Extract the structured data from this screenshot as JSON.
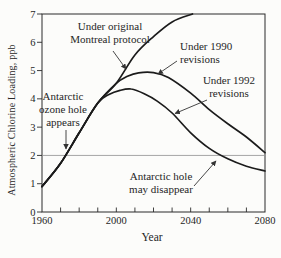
{
  "chart_data": {
    "type": "line",
    "title": "",
    "xlabel": "Year",
    "ylabel": "Atmospheric Chlorine Loading, ppb",
    "xlim": [
      1960,
      2080
    ],
    "ylim": [
      0,
      7
    ],
    "grid": false,
    "x_tick_labels": [
      "1960",
      "2000",
      "2040",
      "2080"
    ],
    "x_minor_ticks": [
      1970,
      1980,
      1990,
      2000,
      2010,
      2020,
      2030,
      2040,
      2050,
      2060,
      2070
    ],
    "y_tick_labels": [
      "0",
      "1",
      "2",
      "3",
      "4",
      "5",
      "6",
      "7"
    ],
    "reference_line_y": 2,
    "series": [
      {
        "name": "Under original Montreal protocol",
        "points": [
          [
            1960,
            0.9
          ],
          [
            1970,
            1.72
          ],
          [
            1980,
            2.8
          ],
          [
            1990,
            3.85
          ],
          [
            2000,
            4.55
          ],
          [
            2010,
            5.55
          ],
          [
            2020,
            6.2
          ],
          [
            2030,
            6.72
          ],
          [
            2041,
            7.0
          ]
        ]
      },
      {
        "name": "Under 1990 revisions",
        "points": [
          [
            1960,
            0.9
          ],
          [
            1970,
            1.72
          ],
          [
            1980,
            2.8
          ],
          [
            1990,
            3.85
          ],
          [
            2000,
            4.55
          ],
          [
            2006,
            4.8
          ],
          [
            2012,
            4.92
          ],
          [
            2020,
            4.93
          ],
          [
            2028,
            4.75
          ],
          [
            2040,
            4.2
          ],
          [
            2050,
            3.62
          ],
          [
            2060,
            3.12
          ],
          [
            2070,
            2.65
          ],
          [
            2080,
            2.1
          ]
        ]
      },
      {
        "name": "Under 1992 revisions",
        "points": [
          [
            1960,
            0.9
          ],
          [
            1970,
            1.72
          ],
          [
            1980,
            2.8
          ],
          [
            1990,
            3.85
          ],
          [
            1996,
            4.15
          ],
          [
            2002,
            4.3
          ],
          [
            2008,
            4.35
          ],
          [
            2015,
            4.18
          ],
          [
            2022,
            3.92
          ],
          [
            2030,
            3.5
          ],
          [
            2040,
            2.8
          ],
          [
            2050,
            2.25
          ],
          [
            2060,
            1.88
          ],
          [
            2070,
            1.62
          ],
          [
            2080,
            1.45
          ]
        ]
      }
    ],
    "annotations": [
      {
        "id": "original-protocol",
        "lines": [
          "Under original",
          "Montreal protocol"
        ]
      },
      {
        "id": "revisions-1990",
        "lines": [
          "Under 1990",
          "revisions"
        ]
      },
      {
        "id": "revisions-1992",
        "lines": [
          "Under 1992",
          "revisions"
        ]
      },
      {
        "id": "ozone-hole-appears",
        "lines": [
          "Antarctic",
          "ozone hole",
          "appears"
        ]
      },
      {
        "id": "ozone-hole-disappear",
        "lines": [
          "Antarctic hole",
          "may disappear"
        ]
      }
    ],
    "colors": {
      "curve": "#1b1b1b",
      "frame": "#2a2a2a",
      "reference_line": "#8f8f8f",
      "arrow": "#333333",
      "text": "#262626",
      "background": "#fcfcfa"
    }
  }
}
